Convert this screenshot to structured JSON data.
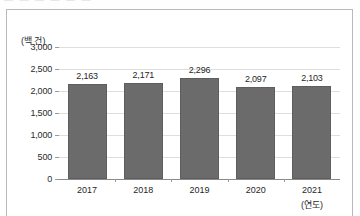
{
  "artifact": {
    "top_cut_text": "—  —  —   —  —  —"
  },
  "chart_data": {
    "type": "bar",
    "title": "",
    "subtitle": "",
    "xlabel": "(연도)",
    "ylabel": "(백 건)",
    "categories": [
      "2017",
      "2018",
      "2019",
      "2020",
      "2021"
    ],
    "values": [
      2163,
      2171,
      2296,
      2097,
      2103
    ],
    "value_labels": [
      "2,163",
      "2,171",
      "2,296",
      "2,097",
      "2,103"
    ],
    "ylim": [
      0,
      3000
    ],
    "yticks": [
      3000,
      2500,
      2000,
      1500,
      1000,
      500,
      0
    ],
    "ytick_labels": [
      "3,000",
      "2,500",
      "2,000",
      "1,500",
      "1,000",
      "500",
      "0"
    ],
    "grid": true,
    "legend": "none",
    "series": [
      {
        "name": "건수",
        "values": [
          2163,
          2171,
          2296,
          2097,
          2103
        ],
        "color": "#6b6b6b"
      }
    ],
    "colors": {
      "bar": "#6b6b6b",
      "bar_border": "#5e5e5e",
      "gridline": "#dedede",
      "axis": "#8a8a8a",
      "text": "#1f1f1f",
      "frame": "#b9b9bd",
      "background": "#ffffff"
    }
  }
}
